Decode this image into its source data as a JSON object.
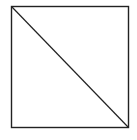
{
  "diagram": {
    "shape": "square-with-diagonal",
    "square": {
      "x": 11,
      "y": 6,
      "width": 117,
      "height": 121,
      "stroke": "#222222"
    },
    "diagonal": {
      "from": [
        11,
        6
      ],
      "to": [
        128,
        127
      ],
      "stroke": "#222222"
    },
    "background": "#ffffff"
  }
}
